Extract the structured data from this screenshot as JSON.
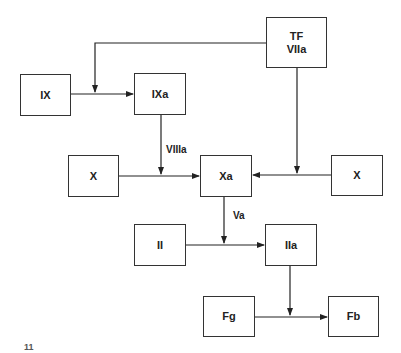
{
  "diagram": {
    "type": "coagulation-cascade-flowchart",
    "nodes": [
      {
        "id": "tf",
        "lines": [
          "TF",
          "VIIa"
        ]
      },
      {
        "id": "ix",
        "label": "IX"
      },
      {
        "id": "ixa",
        "label": "IXa"
      },
      {
        "id": "x_left",
        "label": "X"
      },
      {
        "id": "xa",
        "label": "Xa"
      },
      {
        "id": "x_right",
        "label": "X"
      },
      {
        "id": "ii",
        "label": "II"
      },
      {
        "id": "iia",
        "label": "IIa"
      },
      {
        "id": "fg",
        "label": "Fg"
      },
      {
        "id": "fb",
        "label": "Fb"
      }
    ],
    "edges": [
      {
        "from": "ix",
        "to": "ixa"
      },
      {
        "from": "tf",
        "to": "ix-ixa-junction"
      },
      {
        "from": "tf",
        "to": "x_right-xa-junction"
      },
      {
        "from": "ixa",
        "to": "x_left-xa-junction",
        "label": "VIIIa"
      },
      {
        "from": "x_left",
        "to": "xa"
      },
      {
        "from": "x_right",
        "to": "xa"
      },
      {
        "from": "xa",
        "to": "ii-iia-junction",
        "label": "Va"
      },
      {
        "from": "ii",
        "to": "iia"
      },
      {
        "from": "iia",
        "to": "fg-fb-junction"
      },
      {
        "from": "fg",
        "to": "fb"
      }
    ],
    "edge_labels": {
      "viiia": "VIIIa",
      "va": "Va"
    },
    "caption_fragment": "11"
  }
}
